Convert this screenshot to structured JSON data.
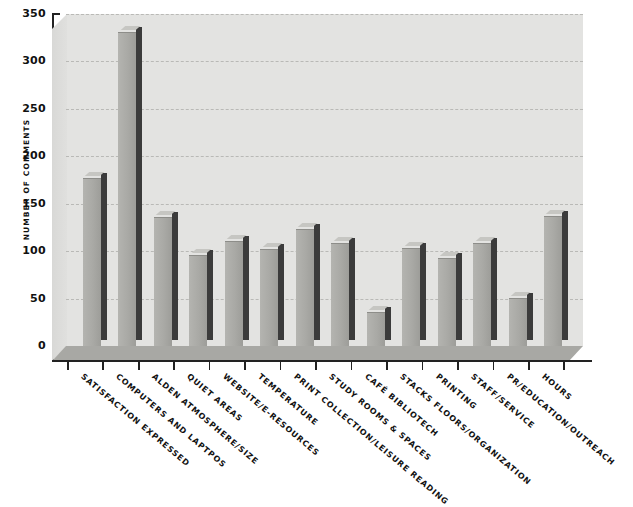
{
  "chart_data": {
    "type": "bar",
    "title": "",
    "xlabel": "",
    "ylabel": "NUMBER OF COMMENTS",
    "ylim": [
      0,
      350
    ],
    "ytick_step": 50,
    "yticks": [
      "0",
      "50",
      "100",
      "150",
      "200",
      "250",
      "300",
      "350"
    ],
    "grid": true,
    "legend": "none",
    "style": "3d-bar",
    "categories": [
      "Satisfaction Expressed",
      "Computers and Laptpos",
      "Alden Atmosphere/Size",
      "Quiet Areas",
      "Website/E-Resources",
      "Temperature",
      "Print Collection/Leisure Reading",
      "Study Rooms & Spaces",
      "Café Bibliotech",
      "Stacks Floors/Organization",
      "Printing",
      "Staff/Service",
      "PR/Education/Outreach",
      "Hours"
    ],
    "values": [
      176,
      330,
      135,
      95,
      110,
      101,
      122,
      108,
      35,
      102,
      92,
      108,
      50,
      136
    ],
    "colors": {
      "bar_face": "#aaaaa6",
      "bar_side": "#3b3b3b",
      "plot_background": "#e3e3e1",
      "floor": "#a8a8a4",
      "gridline": "#b9b9b6",
      "axis": "#222222",
      "text": "#111111"
    }
  }
}
